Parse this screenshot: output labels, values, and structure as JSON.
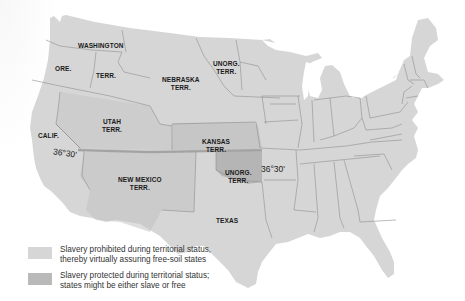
{
  "map": {
    "subject": "Kansas-Nebraska Act territorial map of the United States",
    "colors": {
      "free_soil": "#d6d6d6",
      "slavery_protected": "#b9b9b9",
      "border": "#8a8a8a",
      "line_36_30": "#a3a3a3",
      "label_text": "#1a1a1a"
    },
    "labels": {
      "washington": "WASHINGTON",
      "washington_terr": "TERR.",
      "oregon": "ORE.",
      "nebraska": "NEBRASKA",
      "nebraska_terr": "TERR.",
      "unorg_north": "UNORG.",
      "unorg_north_terr": "TERR.",
      "utah": "UTAH",
      "utah_terr": "TERR.",
      "california": "CALIF.",
      "kansas": "KANSAS",
      "kansas_terr": "TERR.",
      "new_mexico": "NEW MEXICO",
      "new_mexico_terr": "TERR.",
      "unorg_south": "UNORG.",
      "unorg_south_terr": "TERR.",
      "texas": "TEXAS"
    },
    "latitude_line": {
      "label_west": "36°30'",
      "label_east": "36°30'"
    }
  },
  "legend": {
    "items": [
      {
        "line1": "Slavery prohibited during territorial status,",
        "line2": "thereby virtually assuring free-soil states",
        "color": "#d6d6d6"
      },
      {
        "line1": "Slavery protected during territorial status;",
        "line2": "states might be either slave or free",
        "color": "#b9b9b9"
      }
    ]
  }
}
